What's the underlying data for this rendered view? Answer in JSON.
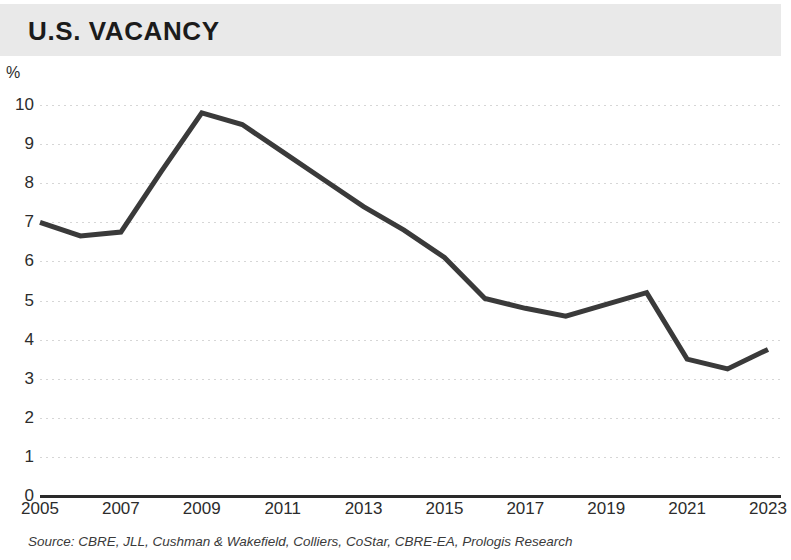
{
  "header": {
    "title": "U.S. VACANCY",
    "band_color": "#e9e9e9"
  },
  "source": {
    "text": "Source: CBRE, JLL, Cushman & Wakefield, Colliers, CoStar, CBRE-EA, Prologis Research"
  },
  "axis": {
    "unit_label": "%",
    "y_ticks": [
      "10",
      "9",
      "8",
      "7",
      "6",
      "5",
      "4",
      "3",
      "2",
      "1",
      "0"
    ],
    "x_ticks": [
      "2005",
      "2007",
      "2009",
      "2011",
      "2013",
      "2015",
      "2017",
      "2019",
      "2021",
      "2023"
    ]
  },
  "chart_data": {
    "type": "line",
    "title": "U.S. VACANCY",
    "xlabel": "",
    "ylabel": "%",
    "ylim": [
      0,
      10
    ],
    "xlim": [
      2005,
      2023
    ],
    "grid": true,
    "legend": "none",
    "line_color": "#3a3a3a",
    "x": [
      2005,
      2006,
      2007,
      2008,
      2009,
      2010,
      2011,
      2012,
      2013,
      2014,
      2015,
      2016,
      2017,
      2018,
      2019,
      2020,
      2021,
      2022,
      2023
    ],
    "values": [
      7.0,
      6.65,
      6.75,
      8.3,
      9.8,
      9.5,
      8.8,
      8.1,
      7.4,
      6.8,
      6.1,
      5.05,
      4.8,
      4.6,
      4.9,
      5.2,
      3.5,
      3.25,
      3.75
    ],
    "series": [
      {
        "name": "U.S. Vacancy",
        "values": [
          7.0,
          6.65,
          6.75,
          8.3,
          9.8,
          9.5,
          8.8,
          8.1,
          7.4,
          6.8,
          6.1,
          5.05,
          4.8,
          4.6,
          4.9,
          5.2,
          3.5,
          3.25,
          3.75
        ]
      }
    ],
    "annotations": []
  }
}
